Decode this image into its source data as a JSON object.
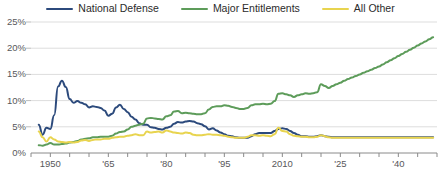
{
  "legend": {
    "position": "top-center",
    "items": [
      {
        "label": "National Defense",
        "color": "#2c4a7c",
        "icon": "line-swatch-icon"
      },
      {
        "label": "Major Entitlements",
        "color": "#5d9c5a",
        "icon": "line-swatch-icon"
      },
      {
        "label": "All Other",
        "color": "#e8d44f",
        "icon": "line-swatch-icon"
      }
    ]
  },
  "axes": {
    "y_ticks": [
      "0%",
      "5%",
      "10%",
      "15%",
      "20%",
      "25%"
    ],
    "y_tick_values": [
      0,
      5,
      10,
      15,
      20,
      25
    ],
    "x_ticks": [
      {
        "label": "1950",
        "value": 1950
      },
      {
        "label": "'65",
        "value": 1965
      },
      {
        "label": "'80",
        "value": 1980
      },
      {
        "label": "'95",
        "value": 1995
      },
      {
        "label": "2010",
        "value": 2010
      },
      {
        "label": "'25",
        "value": 2025
      },
      {
        "label": "'40",
        "value": 2040
      }
    ],
    "x_minor_tick_step": 5,
    "x_minor_tick_start": 1945,
    "x_minor_tick_end": 2050
  },
  "chart_data": {
    "type": "line",
    "title": "",
    "subtitle": "",
    "xlabel": "",
    "ylabel": "",
    "xlim": [
      1945,
      2050
    ],
    "ylim": [
      0,
      25
    ],
    "grid": true,
    "y_gridlines": [
      5,
      10,
      15,
      20,
      25
    ],
    "legend_position": "top-center",
    "x": [
      1947,
      1948,
      1949,
      1950,
      1951,
      1952,
      1953,
      1954,
      1955,
      1956,
      1957,
      1958,
      1959,
      1960,
      1961,
      1962,
      1963,
      1964,
      1965,
      1966,
      1967,
      1968,
      1969,
      1970,
      1971,
      1972,
      1973,
      1974,
      1975,
      1976,
      1977,
      1978,
      1979,
      1980,
      1981,
      1982,
      1983,
      1984,
      1985,
      1986,
      1987,
      1988,
      1989,
      1990,
      1991,
      1992,
      1993,
      1994,
      1995,
      1996,
      1997,
      1998,
      1999,
      2000,
      2001,
      2002,
      2003,
      2004,
      2005,
      2006,
      2007,
      2008,
      2009,
      2010,
      2011,
      2012,
      2013,
      2014,
      2015,
      2016,
      2017,
      2018,
      2019,
      2020,
      2021,
      2022,
      2023,
      2024,
      2025,
      2026,
      2027,
      2028,
      2029,
      2030,
      2031,
      2032,
      2033,
      2034,
      2035,
      2036,
      2037,
      2038,
      2039,
      2040,
      2041,
      2042,
      2043,
      2044,
      2045,
      2046,
      2047,
      2048,
      2049
    ],
    "series": [
      {
        "name": "National Defense",
        "color": "#2c4a7c",
        "values": [
          5.4,
          3.5,
          4.8,
          4.6,
          7.2,
          12.7,
          13.8,
          12.6,
          10.3,
          9.6,
          9.9,
          9.6,
          9.3,
          8.7,
          8.9,
          8.8,
          8.6,
          8.1,
          7.1,
          7.5,
          8.7,
          9.2,
          8.4,
          7.8,
          6.9,
          6.4,
          5.7,
          5.4,
          5.4,
          4.9,
          4.8,
          4.6,
          4.5,
          4.8,
          5.0,
          5.6,
          5.9,
          5.8,
          6.0,
          6.1,
          6.0,
          5.7,
          5.5,
          5.1,
          4.5,
          4.7,
          4.3,
          3.9,
          3.6,
          3.3,
          3.2,
          3.0,
          2.9,
          2.9,
          2.9,
          3.2,
          3.6,
          3.8,
          3.8,
          3.8,
          3.8,
          4.2,
          4.6,
          4.7,
          4.6,
          4.2,
          3.8,
          3.5,
          3.2,
          3.2,
          3.1,
          3.1,
          3.2,
          3.4,
          3.2,
          3.1,
          3.0,
          3.0,
          3.0,
          3.0,
          3.0,
          3.0,
          3.0,
          3.0,
          3.0,
          3.0,
          3.0,
          3.0,
          3.0,
          3.0,
          3.0,
          3.0,
          3.0,
          3.0,
          3.0,
          3.0,
          3.0,
          3.0,
          3.0,
          3.0,
          3.0,
          3.0,
          3.0
        ]
      },
      {
        "name": "Major Entitlements",
        "color": "#5d9c5a",
        "values": [
          1.5,
          1.4,
          1.6,
          1.9,
          1.6,
          1.6,
          1.7,
          1.8,
          2.0,
          2.1,
          2.3,
          2.6,
          2.7,
          2.8,
          3.0,
          3.0,
          3.1,
          3.1,
          3.1,
          3.3,
          3.7,
          4.0,
          4.1,
          4.5,
          5.0,
          5.2,
          5.4,
          5.6,
          6.6,
          6.7,
          6.6,
          6.5,
          6.4,
          7.0,
          7.2,
          7.9,
          8.0,
          7.6,
          7.7,
          7.6,
          7.5,
          7.4,
          7.4,
          7.6,
          8.3,
          8.8,
          8.9,
          8.9,
          9.1,
          9.0,
          8.8,
          8.6,
          8.4,
          8.4,
          8.6,
          9.1,
          9.3,
          9.3,
          9.4,
          9.3,
          9.4,
          9.9,
          11.3,
          11.4,
          11.2,
          11.0,
          10.7,
          11.0,
          11.2,
          11.4,
          11.3,
          11.4,
          11.6,
          13.1,
          12.8,
          12.4,
          12.8,
          13.1,
          13.4,
          13.8,
          14.1,
          14.4,
          14.7,
          15.0,
          15.3,
          15.6,
          15.9,
          16.2,
          16.5,
          16.9,
          17.3,
          17.7,
          18.1,
          18.5,
          18.9,
          19.3,
          19.7,
          20.1,
          20.5,
          20.9,
          21.3,
          21.7,
          22.1
        ]
      },
      {
        "name": "All Other",
        "color": "#e8d44f",
        "values": [
          4.1,
          3.0,
          2.2,
          3.0,
          2.6,
          2.2,
          2.1,
          2.0,
          2.1,
          2.0,
          2.1,
          2.4,
          2.5,
          2.3,
          2.5,
          2.6,
          2.6,
          2.7,
          2.7,
          2.9,
          3.0,
          3.1,
          3.1,
          3.3,
          3.4,
          3.6,
          3.4,
          3.4,
          4.1,
          3.9,
          4.0,
          4.1,
          3.9,
          4.3,
          4.1,
          3.9,
          3.8,
          3.7,
          3.9,
          3.8,
          3.5,
          3.4,
          3.4,
          3.5,
          3.6,
          3.5,
          3.5,
          3.4,
          3.3,
          3.1,
          3.0,
          2.9,
          2.9,
          2.9,
          3.1,
          3.4,
          3.4,
          3.3,
          3.4,
          3.3,
          3.2,
          3.6,
          4.8,
          4.2,
          4.1,
          3.6,
          3.3,
          3.2,
          3.1,
          3.1,
          3.0,
          3.0,
          3.1,
          3.4,
          3.2,
          3.0,
          2.9,
          2.9,
          2.9,
          2.9,
          2.9,
          2.9,
          2.9,
          2.9,
          2.9,
          2.9,
          2.9,
          2.9,
          2.9,
          2.9,
          2.9,
          2.9,
          2.9,
          2.9,
          2.9,
          2.9,
          2.9,
          2.9,
          2.9,
          2.9,
          2.9,
          2.9,
          2.9
        ]
      }
    ]
  }
}
